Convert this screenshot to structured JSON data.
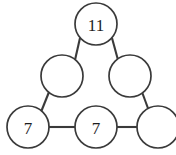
{
  "figure": {
    "background_color": "#ffffff",
    "stroke_color": "#3a3a3a",
    "text_color": "#1d1d1d",
    "width": 176,
    "height": 155
  },
  "nodes": [
    {
      "id": "apex",
      "label": "11",
      "value": "11",
      "cx": 96,
      "cy": 24,
      "r": 21,
      "filled": true
    },
    {
      "id": "mid-left",
      "label": "",
      "value": "",
      "cx": 62,
      "cy": 76,
      "r": 21,
      "filled": false
    },
    {
      "id": "mid-right",
      "label": "",
      "value": "",
      "cx": 130,
      "cy": 76,
      "r": 21,
      "filled": false
    },
    {
      "id": "bottom-left",
      "label": "7",
      "value": "7",
      "cx": 28,
      "cy": 127,
      "r": 21,
      "filled": true
    },
    {
      "id": "bottom-middle",
      "label": "7",
      "value": "7",
      "cx": 96,
      "cy": 127,
      "r": 21,
      "filled": true
    },
    {
      "id": "bottom-right",
      "label": "",
      "value": "",
      "cx": 158,
      "cy": 127,
      "r": 21,
      "filled": false
    }
  ],
  "edges": [
    {
      "id": "apex-to-mid-left",
      "from": "apex",
      "to": "mid-left",
      "x1": 80,
      "y1": 38,
      "x2": 75,
      "y2": 60
    },
    {
      "id": "apex-to-mid-right",
      "from": "apex",
      "to": "mid-right",
      "x1": 112,
      "y1": 38,
      "x2": 118,
      "y2": 60
    },
    {
      "id": "mid-left-to-bottom-left",
      "from": "mid-left",
      "to": "bottom-left",
      "x1": 49,
      "y1": 92,
      "x2": 41,
      "y2": 112
    },
    {
      "id": "mid-right-to-bottom-right",
      "from": "mid-right",
      "to": "bottom-right",
      "x1": 142,
      "y1": 92,
      "x2": 149,
      "y2": 111
    },
    {
      "id": "bottom-left-to-bottom-middle",
      "from": "bottom-left",
      "to": "bottom-middle",
      "x1": 49,
      "y1": 127,
      "x2": 75,
      "y2": 127
    },
    {
      "id": "bottom-middle-to-bottom-right",
      "from": "bottom-middle",
      "to": "bottom-right",
      "x1": 117,
      "y1": 127,
      "x2": 137,
      "y2": 127
    }
  ]
}
